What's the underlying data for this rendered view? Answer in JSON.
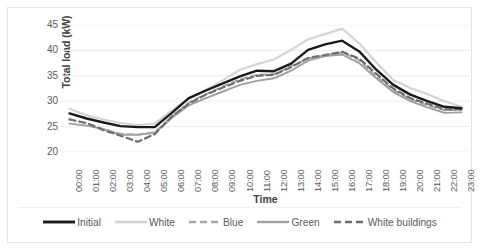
{
  "chart_data": {
    "type": "line",
    "title": "",
    "xlabel": "Time",
    "ylabel": "Total load (kW)",
    "ylim": [
      20,
      45
    ],
    "yticks": [
      20,
      25,
      30,
      35,
      40,
      45
    ],
    "grid": true,
    "legend_position": "bottom",
    "x": [
      "00:00",
      "01:00",
      "02:00",
      "03:00",
      "04:00",
      "05:00",
      "06:00",
      "07:00",
      "08:00",
      "09:00",
      "10:00",
      "11:00",
      "12:00",
      "13:00",
      "14:00",
      "15:00",
      "16:00",
      "17:00",
      "18:00",
      "19:00",
      "20:00",
      "21:00",
      "22:00",
      "23:00"
    ],
    "series": [
      {
        "name": "Initial",
        "color": "#1a1a1a",
        "style": "solid",
        "width": 2.4,
        "values": [
          27.6,
          26.6,
          25.8,
          25.1,
          24.9,
          24.9,
          27.7,
          30.6,
          32.1,
          33.5,
          34.9,
          36.0,
          35.9,
          37.4,
          40.1,
          41.2,
          41.9,
          39.8,
          36.2,
          33.2,
          31.3,
          30.0,
          28.9,
          28.6
        ]
      },
      {
        "name": "White",
        "color": "#d4d4d4",
        "style": "solid",
        "width": 2.2,
        "values": [
          28.5,
          27.2,
          26.4,
          25.7,
          25.3,
          25.6,
          28.2,
          30.5,
          32.3,
          34.1,
          36.2,
          37.3,
          38.2,
          40.1,
          42.2,
          43.2,
          44.3,
          41.4,
          37.6,
          34.2,
          32.6,
          31.4,
          30.0,
          28.9
        ]
      },
      {
        "name": "Blue",
        "color": "#a6a6a6",
        "style": "dashed",
        "width": 1.9,
        "values": [
          26.5,
          25.6,
          24.5,
          23.6,
          23.4,
          23.9,
          27.0,
          29.7,
          31.4,
          32.9,
          34.3,
          35.2,
          35.3,
          36.9,
          38.4,
          39.0,
          39.6,
          38.1,
          34.9,
          32.2,
          30.4,
          29.2,
          28.2,
          28.3
        ]
      },
      {
        "name": "Green",
        "color": "#9e9e9e",
        "style": "solid",
        "width": 1.9,
        "values": [
          25.6,
          25.2,
          24.5,
          23.4,
          23.4,
          23.8,
          26.7,
          29.2,
          30.6,
          31.9,
          33.2,
          34.0,
          34.5,
          36.0,
          38.0,
          38.9,
          39.2,
          37.5,
          34.5,
          31.8,
          30.0,
          28.8,
          27.7,
          27.8
        ]
      },
      {
        "name": "White buildings",
        "color": "#6e6e6e",
        "style": "dashed",
        "width": 2.2,
        "values": [
          26.4,
          25.7,
          24.3,
          23.2,
          22.0,
          23.5,
          27.0,
          29.5,
          31.3,
          32.7,
          34.0,
          35.0,
          35.2,
          36.7,
          38.5,
          39.1,
          39.7,
          38.4,
          35.4,
          32.5,
          30.6,
          29.5,
          28.4,
          28.4
        ]
      }
    ]
  }
}
